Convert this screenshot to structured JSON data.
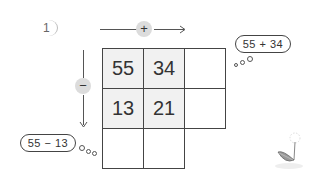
{
  "problem": {
    "number": "1",
    "horizontal_operator": "+",
    "vertical_operator": "−"
  },
  "grid": {
    "rows": [
      [
        "55",
        "34",
        ""
      ],
      [
        "13",
        "21",
        ""
      ],
      [
        "",
        ""
      ]
    ]
  },
  "thought_bubbles": {
    "right": "55 + 34",
    "bottom_left": "55 − 13"
  },
  "decoration": {
    "illustration": "dandelion-leaf-icon"
  }
}
